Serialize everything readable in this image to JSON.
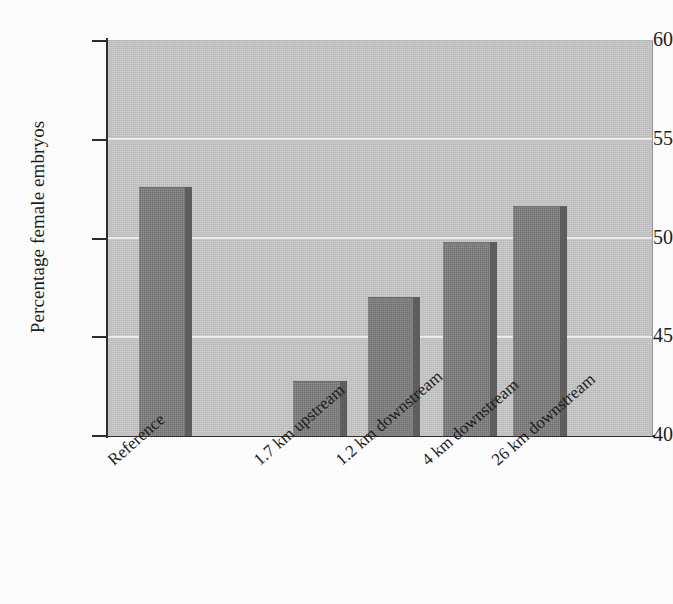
{
  "chart_data": {
    "type": "bar",
    "title": "",
    "xlabel": "",
    "ylabel": "Percentage female embryos",
    "categories": [
      "Reference",
      "1.7 km upstream",
      "1.2 km downstream",
      "4 km downstream",
      "26 km downstream"
    ],
    "values": [
      52.6,
      42.8,
      47.0,
      49.8,
      51.6
    ],
    "ylim": [
      40,
      60
    ],
    "yticks": [
      40,
      45,
      50,
      55,
      60
    ],
    "ytick_labels": [
      "40",
      "45",
      "50",
      "55",
      "60"
    ],
    "grid": true,
    "gridlines_at": [
      45,
      50,
      55
    ],
    "legend": "none",
    "bar_color": "#7f7f7f",
    "bar_side_color": "#5d5d5d",
    "plot_background": "#c9c9c9",
    "gridline_color": "#efefef",
    "axis_color": "#2a2a2a",
    "page_background": "#ffffff",
    "label_rotation_degrees": -41
  }
}
